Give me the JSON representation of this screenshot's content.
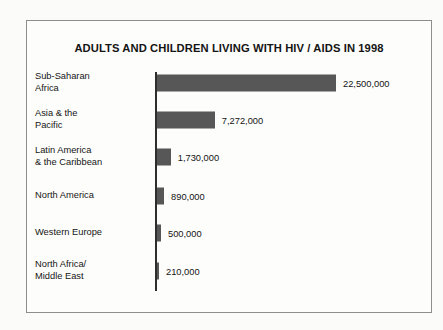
{
  "chart_data": {
    "type": "bar",
    "orientation": "horizontal",
    "title": "ADULTS AND CHILDREN LIVING WITH HIV / AIDS IN 1998",
    "xlabel": "",
    "ylabel": "",
    "grid": false,
    "legend": false,
    "xlim": [
      0,
      22500000
    ],
    "categories": [
      "Sub-Saharan\nAfrica",
      "Asia & the\nPacific",
      "Latin America\n& the Caribbean",
      "North America",
      "Western Europe",
      "North Africa/\nMiddle East"
    ],
    "values": [
      22500000,
      7272000,
      1730000,
      890000,
      500000,
      210000
    ],
    "value_labels": [
      "22,500,000",
      "7,272,000",
      "1,730,000",
      "890,000",
      "500,000",
      "210,000"
    ],
    "bar_color": "#575757",
    "axis_color": "#2e2e2e"
  },
  "rows": [
    {
      "label_line1": "Sub-Saharan",
      "label_line2": "Africa",
      "value_label": "22,500,000",
      "value": 22500000
    },
    {
      "label_line1": "Asia & the",
      "label_line2": "Pacific",
      "value_label": "7,272,000",
      "value": 7272000
    },
    {
      "label_line1": "Latin America",
      "label_line2": "& the Caribbean",
      "value_label": "1,730,000",
      "value": 1730000
    },
    {
      "label_line1": "North America",
      "label_line2": "",
      "value_label": "890,000",
      "value": 890000
    },
    {
      "label_line1": "Western Europe",
      "label_line2": "",
      "value_label": "500,000",
      "value": 500000
    },
    {
      "label_line1": "North Africa/",
      "label_line2": "Middle East",
      "value_label": "210,000",
      "value": 210000
    }
  ]
}
